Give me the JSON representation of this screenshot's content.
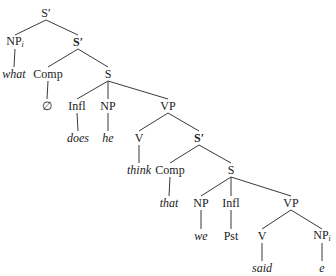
{
  "diagram": {
    "type": "syntax-tree",
    "nodes": [
      {
        "id": "n0",
        "label": "S′",
        "sub": "",
        "x": 46,
        "y": 13,
        "style": "cat",
        "parent": null
      },
      {
        "id": "n1",
        "label": "NP",
        "sub": "i",
        "x": 15,
        "y": 42,
        "style": "cat",
        "parent": "n0"
      },
      {
        "id": "n2",
        "label": "S′",
        "sub": "",
        "x": 78,
        "y": 42,
        "style": "bold",
        "parent": "n0"
      },
      {
        "id": "n3",
        "label": "what",
        "sub": "",
        "x": 14,
        "y": 74,
        "style": "word",
        "parent": "n1"
      },
      {
        "id": "n4",
        "label": "Comp",
        "sub": "",
        "x": 48,
        "y": 74,
        "style": "cat",
        "parent": "n2"
      },
      {
        "id": "n5",
        "label": "S",
        "sub": "",
        "x": 108,
        "y": 74,
        "style": "cat",
        "parent": "n2"
      },
      {
        "id": "n6",
        "label": "∅",
        "sub": "",
        "x": 47,
        "y": 106,
        "style": "cat",
        "parent": "n4"
      },
      {
        "id": "n7",
        "label": "Infl",
        "sub": "",
        "x": 77,
        "y": 106,
        "style": "cat",
        "parent": "n5"
      },
      {
        "id": "n8",
        "label": "NP",
        "sub": "",
        "x": 108,
        "y": 106,
        "style": "cat",
        "parent": "n5"
      },
      {
        "id": "n9",
        "label": "VP",
        "sub": "",
        "x": 168,
        "y": 106,
        "style": "cat",
        "parent": "n5"
      },
      {
        "id": "n10",
        "label": "does",
        "sub": "",
        "x": 78,
        "y": 138,
        "style": "word",
        "parent": "n7"
      },
      {
        "id": "n11",
        "label": "he",
        "sub": "",
        "x": 108,
        "y": 138,
        "style": "word",
        "parent": "n8"
      },
      {
        "id": "n12",
        "label": "V",
        "sub": "",
        "x": 139,
        "y": 138,
        "style": "cat",
        "parent": "n9"
      },
      {
        "id": "n13",
        "label": "S′",
        "sub": "",
        "x": 199,
        "y": 138,
        "style": "bold",
        "parent": "n9"
      },
      {
        "id": "n14",
        "label": "think",
        "sub": "",
        "x": 139,
        "y": 170,
        "style": "word",
        "parent": "n12"
      },
      {
        "id": "n15",
        "label": "Comp",
        "sub": "",
        "x": 170,
        "y": 170,
        "style": "cat",
        "parent": "n13"
      },
      {
        "id": "n16",
        "label": "S",
        "sub": "",
        "x": 231,
        "y": 170,
        "style": "cat",
        "parent": "n13"
      },
      {
        "id": "n17",
        "label": "that",
        "sub": "",
        "x": 169,
        "y": 203,
        "style": "word",
        "parent": "n15"
      },
      {
        "id": "n18",
        "label": "NP",
        "sub": "",
        "x": 201,
        "y": 203,
        "style": "cat",
        "parent": "n16"
      },
      {
        "id": "n19",
        "label": "Infl",
        "sub": "",
        "x": 231,
        "y": 203,
        "style": "cat",
        "parent": "n16"
      },
      {
        "id": "n20",
        "label": "VP",
        "sub": "",
        "x": 291,
        "y": 203,
        "style": "cat",
        "parent": "n16"
      },
      {
        "id": "n21",
        "label": "we",
        "sub": "",
        "x": 201,
        "y": 236,
        "style": "word",
        "parent": "n18"
      },
      {
        "id": "n22",
        "label": "Pst",
        "sub": "",
        "x": 231,
        "y": 236,
        "style": "cat",
        "parent": "n19"
      },
      {
        "id": "n23",
        "label": "V",
        "sub": "",
        "x": 262,
        "y": 236,
        "style": "cat",
        "parent": "n20"
      },
      {
        "id": "n24",
        "label": "NP",
        "sub": "i",
        "x": 322,
        "y": 236,
        "style": "cat",
        "parent": "n20"
      },
      {
        "id": "n25",
        "label": "said",
        "sub": "",
        "x": 262,
        "y": 268,
        "style": "word",
        "parent": "n23"
      },
      {
        "id": "n26",
        "label": "e",
        "sub": "",
        "x": 322,
        "y": 268,
        "style": "word",
        "parent": "n24"
      }
    ],
    "line_color": "#3a3a3a"
  }
}
